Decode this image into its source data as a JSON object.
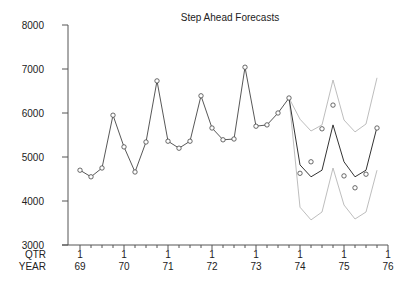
{
  "chart_data": {
    "type": "line",
    "title": "Step Ahead Forecasts",
    "xlabel": "",
    "ylabel": "",
    "ylim": [
      3000,
      8000
    ],
    "yticks": [
      3000,
      4000,
      5000,
      6000,
      7000,
      8000
    ],
    "x_axis_row_labels": [
      "QTR",
      "YEAR"
    ],
    "x_major_ticks": [
      {
        "qtr": "1",
        "year": "69"
      },
      {
        "qtr": "1",
        "year": "70"
      },
      {
        "qtr": "1",
        "year": "71"
      },
      {
        "qtr": "1",
        "year": "72"
      },
      {
        "qtr": "1",
        "year": "73"
      },
      {
        "qtr": "1",
        "year": "74"
      },
      {
        "qtr": "1",
        "year": "75"
      },
      {
        "qtr": "1",
        "year": "76"
      }
    ],
    "x_start": "69Q1",
    "x_end": "76Q1",
    "grid": false,
    "legend": "none",
    "series": [
      {
        "name": "Observed",
        "style": "dark line with circle markers (connected through 73Q4, markers only after)",
        "x": [
          "69Q1",
          "69Q2",
          "69Q3",
          "69Q4",
          "70Q1",
          "70Q2",
          "70Q3",
          "70Q4",
          "71Q1",
          "71Q2",
          "71Q3",
          "71Q4",
          "72Q1",
          "72Q2",
          "72Q3",
          "72Q4",
          "73Q1",
          "73Q2",
          "73Q3",
          "73Q4",
          "74Q1",
          "74Q2",
          "74Q3",
          "74Q4",
          "75Q1",
          "75Q2",
          "75Q3",
          "75Q4"
        ],
        "values": [
          4700,
          4550,
          4750,
          5950,
          5230,
          4660,
          5340,
          6730,
          5360,
          5200,
          5360,
          6390,
          5660,
          5390,
          5410,
          7040,
          5700,
          5730,
          6000,
          6340,
          4630,
          4890,
          5640,
          6180,
          4570,
          4300,
          4610,
          5660
        ],
        "connected_until": "73Q4"
      },
      {
        "name": "Forecast",
        "style": "dark line",
        "x": [
          "73Q4",
          "74Q1",
          "74Q2",
          "74Q3",
          "74Q4",
          "75Q1",
          "75Q2",
          "75Q3",
          "75Q4"
        ],
        "values": [
          6340,
          4820,
          4550,
          4700,
          5730,
          4890,
          4550,
          4700,
          5680
        ]
      },
      {
        "name": "Upper bound",
        "style": "light grey line",
        "x": [
          "73Q4",
          "74Q1",
          "74Q2",
          "74Q3",
          "74Q4",
          "75Q1",
          "75Q2",
          "75Q3",
          "75Q4"
        ],
        "values": [
          6340,
          5860,
          5590,
          5730,
          6750,
          5840,
          5570,
          5750,
          6800
        ]
      },
      {
        "name": "Lower bound",
        "style": "light grey line",
        "x": [
          "73Q4",
          "74Q1",
          "74Q2",
          "74Q3",
          "74Q4",
          "75Q1",
          "75Q2",
          "75Q3",
          "75Q4"
        ],
        "values": [
          6340,
          3860,
          3570,
          3750,
          4750,
          3910,
          3590,
          3750,
          4700
        ]
      }
    ]
  }
}
